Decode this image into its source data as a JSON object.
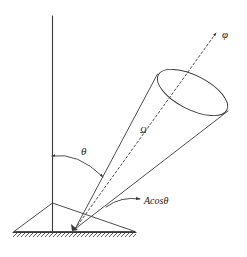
{
  "figure": {
    "type": "solid-angle-diagram",
    "background_color": "#ffffff",
    "stroke_color": "#3a3a3a",
    "labels": {
      "phi": "φ",
      "omega": "Ω",
      "theta": "θ",
      "projected_area": "Acosθ"
    },
    "elements": {
      "vertical_normal_line": "vertical reference line",
      "cone": "cone of solid angle with elliptical opening",
      "cone_axis": "dashed axis line through cone apex toward phi",
      "angle_arc": "double headed arc between vertical line and cone axis",
      "ground_patch": "triangular area patch on ground plane",
      "ground_line": "hatched ground surface line",
      "leader_line": "curved leader with arrowhead pointing to area patch"
    }
  }
}
